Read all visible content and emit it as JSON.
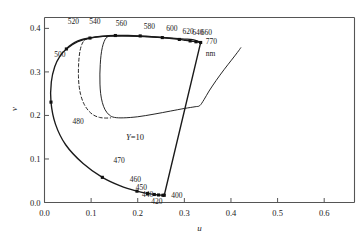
{
  "chart_data": {
    "type": "line",
    "title": "",
    "xlabel": "u",
    "ylabel": "v",
    "xlim": [
      0.0,
      0.665
    ],
    "ylim": [
      0.0,
      0.425
    ],
    "grid": false,
    "legend": null,
    "xticks": [
      "0.0",
      "0.1",
      "0.2",
      "0.3",
      "0.4",
      "0.5",
      "0.6"
    ],
    "xtick_values": [
      0.0,
      0.1,
      0.2,
      0.3,
      0.4,
      0.5,
      0.6
    ],
    "yticks": [
      "0.0",
      "0.1",
      "0.2",
      "0.3",
      "0.4"
    ],
    "ytick_values": [
      0.0,
      0.1,
      0.2,
      0.3,
      0.4
    ],
    "units_note": "nm",
    "annotations": [
      {
        "text": "Y=10",
        "u": 0.175,
        "v": 0.163,
        "italic_lead": true
      }
    ],
    "series": [
      {
        "name": "spectral-locus",
        "style": "solid-with-square-markers",
        "points": [
          {
            "u": 0.2569,
            "v": 0.0166,
            "wl": 400
          },
          {
            "u": 0.2558,
            "v": 0.0165,
            "wl": 410
          },
          {
            "u": 0.254,
            "v": 0.0166,
            "wl": 420
          },
          {
            "u": 0.2503,
            "v": 0.0168,
            "wl": 430
          },
          {
            "u": 0.2447,
            "v": 0.0173,
            "wl": 440
          },
          {
            "u": 0.2355,
            "v": 0.0184,
            "wl": 450
          },
          {
            "u": 0.2211,
            "v": 0.0208,
            "wl": 460
          },
          {
            "u": 0.1984,
            "v": 0.026,
            "wl": 470
          },
          {
            "u": 0.1627,
            "v": 0.0382,
            "wl": 475
          },
          {
            "u": 0.1241,
            "v": 0.0578,
            "wl": 480
          },
          {
            "u": 0.0828,
            "v": 0.0895,
            "wl": 485
          },
          {
            "u": 0.0454,
            "v": 0.1327,
            "wl": 490
          },
          {
            "u": 0.0235,
            "v": 0.1801,
            "wl": 495
          },
          {
            "u": 0.0139,
            "v": 0.2306,
            "wl": 500
          },
          {
            "u": 0.0146,
            "v": 0.2767,
            "wl": 505
          },
          {
            "u": 0.0219,
            "v": 0.3118,
            "wl": 510
          },
          {
            "u": 0.0332,
            "v": 0.3362,
            "wl": 515
          },
          {
            "u": 0.0469,
            "v": 0.3527,
            "wl": 520
          },
          {
            "u": 0.0713,
            "v": 0.3693,
            "wl": 530
          },
          {
            "u": 0.0975,
            "v": 0.3778,
            "wl": 540
          },
          {
            "u": 0.1247,
            "v": 0.382,
            "wl": 550
          },
          {
            "u": 0.152,
            "v": 0.3836,
            "wl": 560
          },
          {
            "u": 0.179,
            "v": 0.3837,
            "wl": 570
          },
          {
            "u": 0.2053,
            "v": 0.3827,
            "wl": 580
          },
          {
            "u": 0.23,
            "v": 0.3811,
            "wl": 590
          },
          {
            "u": 0.2527,
            "v": 0.3789,
            "wl": 600
          },
          {
            "u": 0.2727,
            "v": 0.3767,
            "wl": 610
          },
          {
            "u": 0.2892,
            "v": 0.3746,
            "wl": 620
          },
          {
            "u": 0.3022,
            "v": 0.3727,
            "wl": 630
          },
          {
            "u": 0.3124,
            "v": 0.3712,
            "wl": 640
          },
          {
            "u": 0.3198,
            "v": 0.37,
            "wl": 650
          },
          {
            "u": 0.325,
            "v": 0.3692,
            "wl": 660
          },
          {
            "u": 0.3289,
            "v": 0.3686,
            "wl": 670
          },
          {
            "u": 0.3315,
            "v": 0.3682,
            "wl": 680
          },
          {
            "u": 0.3331,
            "v": 0.3679,
            "wl": 690
          },
          {
            "u": 0.3341,
            "v": 0.3677,
            "wl": 700
          },
          {
            "u": 0.335,
            "v": 0.3676,
            "wl": 770
          }
        ]
      },
      {
        "name": "purple-line",
        "style": "solid",
        "points": [
          {
            "u": 0.335,
            "v": 0.3676
          },
          {
            "u": 0.2569,
            "v": 0.0166
          }
        ]
      },
      {
        "name": "object-color-solid-boundary",
        "style": "solid",
        "points": [
          {
            "u": 0.0468,
            "v": 0.3525
          },
          {
            "u": 0.054,
            "v": 0.36
          },
          {
            "u": 0.065,
            "v": 0.368
          },
          {
            "u": 0.079,
            "v": 0.374
          },
          {
            "u": 0.094,
            "v": 0.3775
          },
          {
            "u": 0.11,
            "v": 0.38
          },
          {
            "u": 0.126,
            "v": 0.3815
          },
          {
            "u": 0.142,
            "v": 0.3822
          },
          {
            "u": 0.16,
            "v": 0.3826
          },
          {
            "u": 0.18,
            "v": 0.3824
          },
          {
            "u": 0.2,
            "v": 0.3818
          },
          {
            "u": 0.22,
            "v": 0.3808
          },
          {
            "u": 0.24,
            "v": 0.3797
          },
          {
            "u": 0.26,
            "v": 0.3784
          },
          {
            "u": 0.28,
            "v": 0.377
          },
          {
            "u": 0.3,
            "v": 0.3755
          },
          {
            "u": 0.318,
            "v": 0.3742
          },
          {
            "u": 0.33,
            "v": 0.37
          },
          {
            "u": 0.335,
            "v": 0.3676
          }
        ]
      },
      {
        "name": "gamut-solid-inner",
        "style": "solid",
        "points": [
          {
            "u": 0.14,
            "v": 0.3832
          },
          {
            "u": 0.133,
            "v": 0.379
          },
          {
            "u": 0.128,
            "v": 0.37
          },
          {
            "u": 0.124,
            "v": 0.356
          },
          {
            "u": 0.1212,
            "v": 0.338
          },
          {
            "u": 0.1196,
            "v": 0.317
          },
          {
            "u": 0.1188,
            "v": 0.295
          },
          {
            "u": 0.119,
            "v": 0.272
          },
          {
            "u": 0.1205,
            "v": 0.25
          },
          {
            "u": 0.124,
            "v": 0.23
          },
          {
            "u": 0.13,
            "v": 0.213
          },
          {
            "u": 0.139,
            "v": 0.201
          },
          {
            "u": 0.15,
            "v": 0.1955
          },
          {
            "u": 0.17,
            "v": 0.1945
          },
          {
            "u": 0.2,
            "v": 0.197
          },
          {
            "u": 0.235,
            "v": 0.203
          },
          {
            "u": 0.27,
            "v": 0.21
          },
          {
            "u": 0.3,
            "v": 0.216
          },
          {
            "u": 0.323,
            "v": 0.22
          },
          {
            "u": 0.333,
            "v": 0.2225
          },
          {
            "u": 0.342,
            "v": 0.236
          },
          {
            "u": 0.353,
            "v": 0.256
          },
          {
            "u": 0.368,
            "v": 0.28
          },
          {
            "u": 0.385,
            "v": 0.305
          },
          {
            "u": 0.401,
            "v": 0.327
          },
          {
            "u": 0.414,
            "v": 0.345
          },
          {
            "u": 0.421,
            "v": 0.3555
          }
        ]
      },
      {
        "name": "gamut-dashed-inner",
        "style": "dashed",
        "points": [
          {
            "u": 0.092,
            "v": 0.3768
          },
          {
            "u": 0.085,
            "v": 0.372
          },
          {
            "u": 0.08,
            "v": 0.363
          },
          {
            "u": 0.0765,
            "v": 0.35
          },
          {
            "u": 0.0742,
            "v": 0.333
          },
          {
            "u": 0.073,
            "v": 0.313
          },
          {
            "u": 0.0728,
            "v": 0.292
          },
          {
            "u": 0.074,
            "v": 0.27
          },
          {
            "u": 0.0775,
            "v": 0.248
          },
          {
            "u": 0.084,
            "v": 0.228
          },
          {
            "u": 0.0935,
            "v": 0.212
          },
          {
            "u": 0.105,
            "v": 0.201
          },
          {
            "u": 0.118,
            "v": 0.1955
          },
          {
            "u": 0.131,
            "v": 0.194
          },
          {
            "u": 0.142,
            "v": 0.1945
          }
        ]
      }
    ],
    "wavelength_labels": [
      {
        "text": "520",
        "u": 0.05,
        "v": 0.415,
        "anchor": "start"
      },
      {
        "text": "540",
        "u": 0.096,
        "v": 0.415,
        "anchor": "start"
      },
      {
        "text": "560",
        "u": 0.153,
        "v": 0.411,
        "anchor": "start"
      },
      {
        "text": "580",
        "u": 0.213,
        "v": 0.404,
        "anchor": "start"
      },
      {
        "text": "600",
        "u": 0.261,
        "v": 0.3975,
        "anchor": "start"
      },
      {
        "text": "620",
        "u": 0.296,
        "v": 0.3925,
        "anchor": "start"
      },
      {
        "text": "640",
        "u": 0.317,
        "v": 0.3895,
        "anchor": "start"
      },
      {
        "text": "660",
        "u": 0.335,
        "v": 0.3895,
        "anchor": "start"
      },
      {
        "text": "770",
        "u": 0.346,
        "v": 0.368,
        "anchor": "start"
      },
      {
        "text": "nm",
        "u": 0.346,
        "v": 0.342,
        "anchor": "start"
      },
      {
        "text": "500",
        "u": 0.021,
        "v": 0.339,
        "anchor": "start"
      },
      {
        "text": "480",
        "u": 0.06,
        "v": 0.186,
        "anchor": "start"
      },
      {
        "text": "470",
        "u": 0.148,
        "v": 0.095,
        "anchor": "start"
      },
      {
        "text": "460",
        "u": 0.183,
        "v": 0.052,
        "anchor": "start"
      },
      {
        "text": "450",
        "u": 0.196,
        "v": 0.033,
        "anchor": "start"
      },
      {
        "text": "440",
        "u": 0.209,
        "v": 0.017,
        "anchor": "start"
      },
      {
        "text": "420",
        "u": 0.229,
        "v": 0.001,
        "anchor": "start"
      },
      {
        "text": "400",
        "u": 0.272,
        "v": 0.015,
        "anchor": "start"
      }
    ],
    "marker_wavelengths": [
      400,
      420,
      440,
      450,
      460,
      470,
      480,
      500,
      520,
      540,
      560,
      580,
      600,
      620,
      640,
      660,
      770
    ]
  },
  "style": {
    "line_color": "#1a1a1a",
    "marker_color": "#111111",
    "axis_color": "#555555",
    "background": "#ffffff"
  }
}
